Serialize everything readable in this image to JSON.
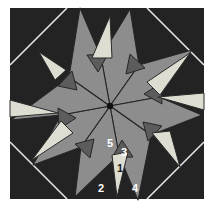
{
  "figure": {
    "description_label": "quilt block pattern diagram with numbered pieces",
    "canvas": {
      "width": 215,
      "height": 212,
      "page_bg": "#ffffff"
    }
  },
  "pattern": {
    "square": {
      "x": 10,
      "y": 8,
      "w": 194,
      "h": 191
    },
    "colors": {
      "background": "#232323",
      "seam": "#e6e6e6",
      "dart": "#8d8d8d",
      "ring": "#5c5c5c",
      "light": "#deddd2",
      "outline": "#262626",
      "light_outline": "#2a2a2a",
      "dot": "#111111",
      "label_light": "#ffffff",
      "label_dark": "#1a1a1a"
    },
    "corner_seams": [
      {
        "name": "top-left-seam",
        "x1": 10,
        "y1": 65,
        "x2": 67,
        "y2": 8
      },
      {
        "name": "top-right-seam",
        "x1": 147,
        "y1": 8,
        "x2": 204,
        "y2": 65
      },
      {
        "name": "bottom-right-seam",
        "x1": 204,
        "y1": 142,
        "x2": 147,
        "y2": 199
      },
      {
        "name": "bottom-left-seam",
        "x1": 67,
        "y1": 199,
        "x2": 10,
        "y2": 142
      }
    ],
    "darts": [
      {
        "dir": "N",
        "points": "110,106 101,57 130,9 139,65"
      },
      {
        "dir": "NE",
        "points": "110,106 139,65 192,50 159,97"
      },
      {
        "dir": "E",
        "points": "110,106 159,97 202,115 151,135"
      },
      {
        "dir": "SE",
        "points": "110,106 151,135 138,200 119,155"
      },
      {
        "dir": "S",
        "points": "110,106 119,155 75,197 81,147"
      },
      {
        "dir": "SW",
        "points": "110,106 81,147 33,165 61,115"
      },
      {
        "dir": "W",
        "points": "110,106 61,115 11,120 69,77"
      },
      {
        "dir": "NW",
        "points": "110,106 69,77 80,8 101,57"
      }
    ],
    "ring_triangles": [
      {
        "dir": "S",
        "points": "122,140 133,157 112,158"
      },
      {
        "dir": "SW",
        "points": "94,139 90,158 75,144"
      },
      {
        "dir": "W",
        "points": "76,118 59,129 58,108"
      },
      {
        "dir": "NW",
        "points": "77,90 58,86 72,71"
      },
      {
        "dir": "N",
        "points": "98,72 87,55 108,54"
      },
      {
        "dir": "NE",
        "points": "126,74 130,54 145,68"
      },
      {
        "dir": "E",
        "points": "144,94 161,83 162,104"
      },
      {
        "dir": "SE",
        "points": "143,122 162,126 148,141"
      }
    ],
    "light_triangles": [
      {
        "dir": "N",
        "points": "110,16 92,58 112,58"
      },
      {
        "dir": "NE",
        "points": "190,53 147,82 160,95"
      },
      {
        "dir": "E",
        "points": "204,93 158,97 204,110"
      },
      {
        "dir": "SE",
        "points": "170,131 152,133 180,167"
      },
      {
        "dir": "S",
        "points": "112,155 128,152 117,197"
      },
      {
        "dir": "SW",
        "points": "73,133 61,121 32,160"
      },
      {
        "dir": "W",
        "points": "10,117 58,113 10,100"
      },
      {
        "dir": "NW",
        "points": "39,52 66,70 55,80"
      }
    ],
    "center_dot": {
      "cx": 110,
      "cy": 106,
      "r": 3.2
    },
    "labels": [
      {
        "text": "1",
        "x": 120,
        "y": 172,
        "tone": "dark"
      },
      {
        "text": "2",
        "x": 101,
        "y": 192,
        "tone": "light"
      },
      {
        "text": "3",
        "x": 124,
        "y": 156,
        "tone": "light"
      },
      {
        "text": "4",
        "x": 135,
        "y": 192,
        "tone": "light"
      },
      {
        "text": "5",
        "x": 110,
        "y": 147,
        "tone": "light"
      }
    ]
  }
}
